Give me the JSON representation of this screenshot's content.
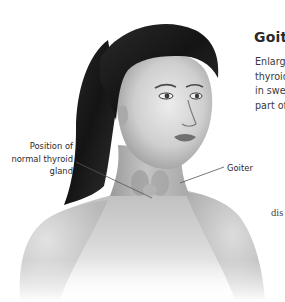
{
  "article": {
    "title": "Goit",
    "body_lines": [
      "Enlarge",
      "thyroid",
      "in swel",
      "part of"
    ],
    "trailing_fragment": "dis"
  },
  "illustration": {
    "subject": "woman-head-neck-shoulders",
    "labels": {
      "normal_thyroid": [
        "Position of",
        "normal thyroid",
        "gland"
      ],
      "goiter": "Goiter"
    }
  },
  "colors": {
    "background": "#ffffff",
    "text": "#2a2a2a",
    "hair": "#1e1e1e",
    "skin_light": "#e8e8e8",
    "skin_mid": "#bdbdbd",
    "skin_dark": "#8a8a8a",
    "leader_line": "#555555"
  }
}
